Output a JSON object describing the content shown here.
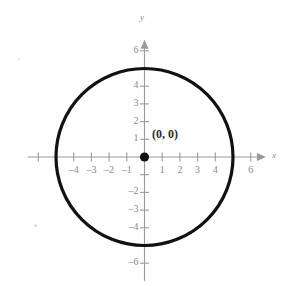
{
  "figure": {
    "kind": "coordinate-plane-with-circle",
    "background_color": "#fefefe",
    "axis_color": "#9a9a9a",
    "curve_color": "#111111",
    "label_color": "#8a8a8a",
    "point_color": "#111111"
  },
  "axes": {
    "x_name": "x",
    "y_name": "y",
    "x_ticks": [
      {
        "value": -6,
        "label": ""
      },
      {
        "value": -5,
        "label": ""
      },
      {
        "value": -4,
        "label": "–4"
      },
      {
        "value": -3,
        "label": "–3"
      },
      {
        "value": -2,
        "label": "–2"
      },
      {
        "value": -1,
        "label": "–1"
      },
      {
        "value": 1,
        "label": "1"
      },
      {
        "value": 2,
        "label": "2"
      },
      {
        "value": 3,
        "label": "3"
      },
      {
        "value": 4,
        "label": "4"
      },
      {
        "value": 5,
        "label": ""
      },
      {
        "value": 6,
        "label": "6"
      }
    ],
    "y_ticks": [
      {
        "value": 6,
        "label": "6"
      },
      {
        "value": 5,
        "label": ""
      },
      {
        "value": 4,
        "label": "4"
      },
      {
        "value": 3,
        "label": "3"
      },
      {
        "value": 2,
        "label": "2"
      },
      {
        "value": 1,
        "label": "1"
      },
      {
        "value": -1,
        "label": ""
      },
      {
        "value": -2,
        "label": "–2"
      },
      {
        "value": -3,
        "label": "–3"
      },
      {
        "value": -4,
        "label": "–4"
      },
      {
        "value": -5,
        "label": ""
      },
      {
        "value": -6,
        "label": "–6"
      }
    ],
    "x_range": [
      -6.6,
      7.2
    ],
    "y_range": [
      -7.0,
      6.9
    ],
    "arrows": {
      "x_right": true,
      "y_top": true,
      "x_left": false,
      "y_bottom": false
    }
  },
  "annotations": {
    "origin_point_label": "(0, 0)"
  },
  "chart_data": {
    "type": "scatter",
    "title": "",
    "xlabel": "x",
    "ylabel": "y",
    "grid": false,
    "legend": "none",
    "xlim": [
      -6.6,
      7.2
    ],
    "ylim": [
      -7.0,
      6.9
    ],
    "xticks": [
      -4,
      -3,
      -2,
      -1,
      1,
      2,
      3,
      4,
      6
    ],
    "yticks": [
      6,
      4,
      3,
      2,
      1,
      -2,
      -3,
      -4,
      -6
    ],
    "series": [
      {
        "name": "circle",
        "kind": "circle",
        "center": [
          0,
          0
        ],
        "radius": 5,
        "equation_implied": "x^2 + y^2 = 25",
        "stroke": "#111111",
        "stroke_width": 3.2,
        "fill": "none"
      },
      {
        "name": "center-point",
        "kind": "point",
        "x": [
          0
        ],
        "y": [
          0
        ],
        "label": "(0, 0)",
        "marker": "filled-circle",
        "color": "#111111"
      }
    ]
  }
}
